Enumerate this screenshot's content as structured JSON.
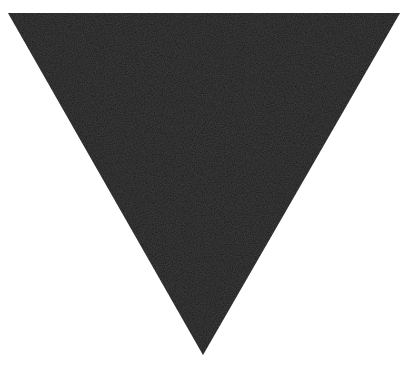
{
  "figure": {
    "shape": "inverted-triangle",
    "fill_color": "#1c1c1c",
    "background_color": "#ffffff",
    "vertices": {
      "top_left": [
        8,
        13
      ],
      "top_right": [
        400,
        13
      ],
      "bottom": [
        203,
        355
      ]
    }
  }
}
